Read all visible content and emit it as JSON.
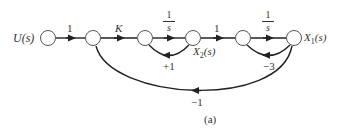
{
  "figure": {
    "caption": "(a)",
    "type": "signal-flow-graph"
  },
  "nodes": [
    {
      "id": "U",
      "label": "U(s)",
      "x": 48,
      "y": 38
    },
    {
      "id": "n2",
      "label": "",
      "x": 93,
      "y": 38
    },
    {
      "id": "n3",
      "label": "",
      "x": 145,
      "y": 38
    },
    {
      "id": "X2",
      "label": "X2(s)",
      "x": 193,
      "y": 38
    },
    {
      "id": "n5",
      "label": "",
      "x": 243,
      "y": 38
    },
    {
      "id": "X1",
      "label": "X1(s)",
      "x": 294,
      "y": 38
    }
  ],
  "labels": {
    "input": "U(s)",
    "x2_main": "X",
    "x2_sub": "2",
    "x2_tail": "(s)",
    "x1_main": "X",
    "x1_sub": "1",
    "x1_tail": "(s)"
  },
  "branches": {
    "b1": {
      "from": "U",
      "to": "n2",
      "gain": "1"
    },
    "b2": {
      "from": "n2",
      "to": "n3",
      "gain": "K"
    },
    "b3": {
      "from": "n3",
      "to": "X2",
      "gain_num": "1",
      "gain_den": "s"
    },
    "b4": {
      "from": "X2",
      "to": "n5",
      "gain": "1"
    },
    "b5": {
      "from": "n5",
      "to": "X1",
      "gain_num": "1",
      "gain_den": "s"
    },
    "fb1": {
      "from": "X2",
      "to": "n3",
      "gain": "+1"
    },
    "fb2": {
      "from": "X1",
      "to": "n5",
      "gain": "−3"
    },
    "fb3": {
      "from": "X1",
      "to": "n2",
      "gain": "−1"
    }
  },
  "colors": {
    "stroke": "#222222",
    "node_fill": "#ffffff",
    "text": "#333333"
  }
}
